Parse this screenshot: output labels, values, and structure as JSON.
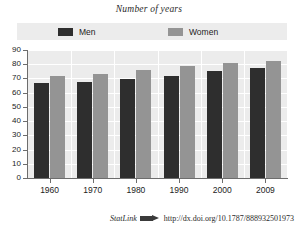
{
  "figure": {
    "title": "Number of years",
    "background_color": "#ffffff",
    "plot_background_color": "#ececec"
  },
  "legend": {
    "position": "top",
    "entries": [
      {
        "label": "Men",
        "color": "#2e2e2e",
        "swatch": "men-swatch"
      },
      {
        "label": "Women",
        "color": "#949494",
        "swatch": "women-swatch"
      }
    ]
  },
  "axes": {
    "y_ticks": [
      "90",
      "80",
      "70",
      "60",
      "50",
      "40",
      "30",
      "20",
      "10",
      "0"
    ],
    "x_ticks": [
      "1960",
      "1970",
      "1980",
      "1990",
      "2000",
      "2009"
    ]
  },
  "footer": {
    "statlink_label": "StatLink",
    "statlink_icon": "statlink-arrow-icon",
    "url": "http://dx.doi.org/10.1787/888932501973"
  },
  "chart_data": {
    "type": "bar",
    "title": "Number of years",
    "xlabel": "",
    "ylabel": "Number of years",
    "ylim": [
      0,
      90
    ],
    "ytick_step": 10,
    "grid": true,
    "legend_position": "top",
    "categories": [
      "1960",
      "1970",
      "1980",
      "1990",
      "2000",
      "2009"
    ],
    "series": [
      {
        "name": "Men",
        "color": "#2e2e2e",
        "values": [
          66.5,
          67.3,
          69.5,
          71.8,
          75.0,
          77.5
        ]
      },
      {
        "name": "Women",
        "color": "#949494",
        "values": [
          71.5,
          73.0,
          76.0,
          78.5,
          81.0,
          82.5
        ]
      }
    ]
  }
}
